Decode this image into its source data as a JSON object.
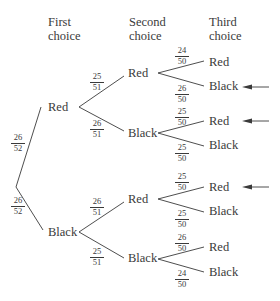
{
  "headers": {
    "first": [
      "First",
      "choice"
    ],
    "second": [
      "Second",
      "choice"
    ],
    "third": [
      "Third",
      "choice"
    ]
  },
  "tree": {
    "level1": [
      {
        "label": "Red",
        "prob_num": "26",
        "prob_den": "52"
      },
      {
        "label": "Black",
        "prob_num": "26",
        "prob_den": "52"
      }
    ],
    "level2": [
      {
        "parent": "Red",
        "label": "Red",
        "prob_num": "25",
        "prob_den": "51"
      },
      {
        "parent": "Red",
        "label": "Black",
        "prob_num": "26",
        "prob_den": "51"
      },
      {
        "parent": "Black",
        "label": "Red",
        "prob_num": "26",
        "prob_den": "51"
      },
      {
        "parent": "Black",
        "label": "Black",
        "prob_num": "25",
        "prob_den": "51"
      }
    ],
    "level3": [
      {
        "path": "Red-Red",
        "label": "Red",
        "prob_num": "24",
        "prob_den": "50",
        "arrow": false
      },
      {
        "path": "Red-Red",
        "label": "Black",
        "prob_num": "26",
        "prob_den": "50",
        "arrow": true
      },
      {
        "path": "Red-Black",
        "label": "Red",
        "prob_num": "25",
        "prob_den": "50",
        "arrow": true
      },
      {
        "path": "Red-Black",
        "label": "Black",
        "prob_num": "25",
        "prob_den": "50",
        "arrow": false
      },
      {
        "path": "Black-Red",
        "label": "Red",
        "prob_num": "25",
        "prob_den": "50",
        "arrow": true
      },
      {
        "path": "Black-Red",
        "label": "Black",
        "prob_num": "25",
        "prob_den": "50",
        "arrow": false
      },
      {
        "path": "Black-Black",
        "label": "Red",
        "prob_num": "26",
        "prob_den": "50",
        "arrow": false
      },
      {
        "path": "Black-Black",
        "label": "Black",
        "prob_num": "24",
        "prob_den": "50",
        "arrow": false
      }
    ]
  },
  "colors": {
    "ink": "#3a3a3a",
    "background": "#ffffff"
  }
}
